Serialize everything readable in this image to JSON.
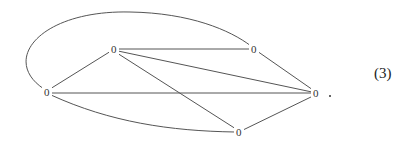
{
  "graph": {
    "nodes": [
      {
        "id": "left",
        "label": "0",
        "x": 47,
        "y": 92
      },
      {
        "id": "top",
        "label": "0",
        "x": 114,
        "y": 49
      },
      {
        "id": "top_right",
        "label": "0",
        "x": 254,
        "y": 49
      },
      {
        "id": "right",
        "label": "0",
        "x": 316,
        "y": 93
      },
      {
        "id": "bottom",
        "label": "0",
        "x": 239,
        "y": 132
      }
    ],
    "edges": [
      [
        "left",
        "top"
      ],
      [
        "left",
        "right"
      ],
      [
        "left",
        "bottom"
      ],
      [
        "left",
        "top_right"
      ],
      [
        "top",
        "top_right"
      ],
      [
        "top",
        "right"
      ],
      [
        "top",
        "bottom"
      ],
      [
        "top_right",
        "right"
      ],
      [
        "bottom",
        "right"
      ]
    ],
    "period": ".",
    "equation_number": "(3)"
  }
}
